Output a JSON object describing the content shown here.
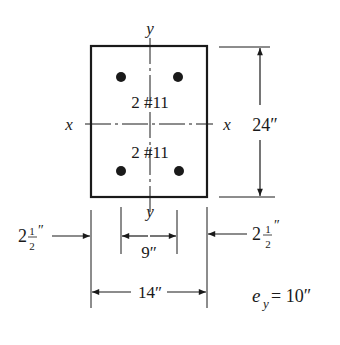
{
  "section": {
    "axis_y_top": "y",
    "axis_y_bottom": "y",
    "axis_x_left": "x",
    "axis_x_right": "x",
    "top_bars_label": "2 #11",
    "bottom_bars_label": "2 #11"
  },
  "dimensions": {
    "height": "24″",
    "width": "14″",
    "bar_spacing": "9″",
    "cover_left_whole": "2",
    "cover_left_num": "1",
    "cover_left_den": "2",
    "cover_left_unit": "″",
    "cover_right_whole": "2",
    "cover_right_num": "1",
    "cover_right_den": "2",
    "cover_right_unit": "″"
  },
  "eccentricity": {
    "symbol": "e",
    "subscript": "y",
    "equals": "= 10″"
  },
  "colors": {
    "ink": "#1a1a1a",
    "background": "#ffffff"
  }
}
